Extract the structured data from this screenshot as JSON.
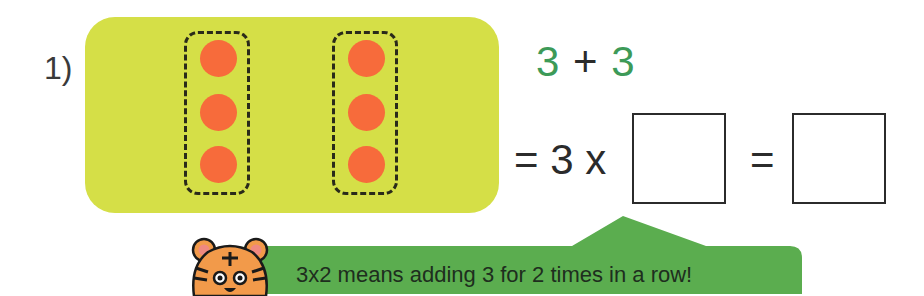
{
  "problem": {
    "number_label": "1)",
    "groups": [
      {
        "dots": 3
      },
      {
        "dots": 3
      }
    ],
    "addition": {
      "left": "3",
      "operator": "+",
      "right": "3"
    },
    "multiplication": {
      "equals": "=",
      "factor": "3",
      "times": "x",
      "blank_factor": "",
      "equals2": "=",
      "blank_result": ""
    }
  },
  "hint": {
    "mascot": "tiger-face-icon",
    "text": "3x2 means adding 3 for 2 times in a row!"
  },
  "colors": {
    "panel": "#d5df47",
    "dot": "#f76b3b",
    "number_green": "#3d9a58",
    "callout_green": "#5bad4f"
  }
}
